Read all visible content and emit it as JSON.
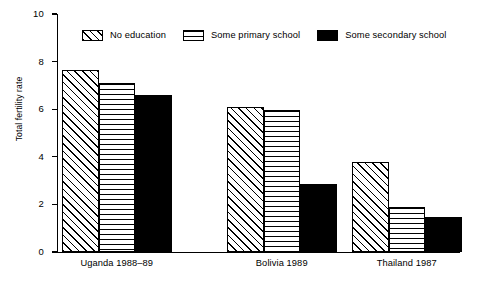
{
  "chart_data": {
    "type": "bar",
    "title": "",
    "xlabel": "",
    "ylabel": "Total fertility rate",
    "ylim": [
      0,
      10
    ],
    "yticks": [
      0,
      2,
      4,
      6,
      8,
      10
    ],
    "ytick_labels": [
      "0",
      "2",
      "4",
      "6",
      "8",
      "10"
    ],
    "grid": false,
    "legend_position": "top",
    "categories": [
      "Uganda 1988–89",
      "Bolivia 1989",
      "Thailand 1987"
    ],
    "series": [
      {
        "name": "No  education",
        "pattern": "diagonal-hatch",
        "values": [
          7.65,
          6.1,
          3.8
        ]
      },
      {
        "name": "Some primary school",
        "pattern": "horizontal-lines",
        "values": [
          7.1,
          5.95,
          1.9
        ]
      },
      {
        "name": "Some secondary school",
        "pattern": "solid-black",
        "values": [
          6.6,
          2.85,
          1.45
        ]
      }
    ]
  },
  "colors": {
    "foreground": "#000000",
    "background": "#ffffff"
  }
}
